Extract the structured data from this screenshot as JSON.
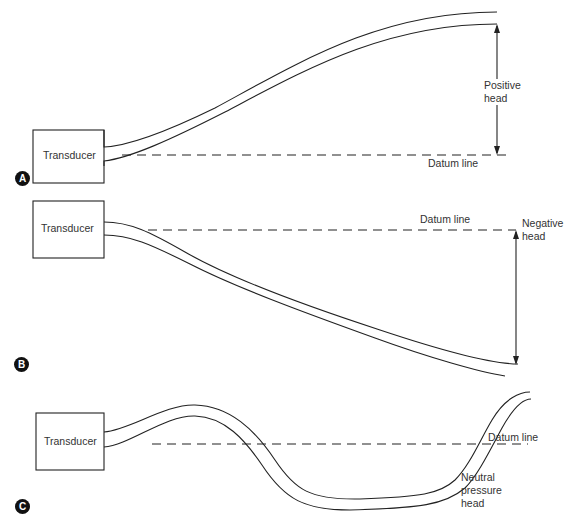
{
  "panels": [
    {
      "id": "A",
      "badge": "A",
      "transducer_label": "Transducer",
      "datum_label": "Datum line",
      "head_label_line1": "Positive",
      "head_label_line2": "head"
    },
    {
      "id": "B",
      "badge": "B",
      "transducer_label": "Transducer",
      "datum_label": "Datum line",
      "head_label_line1": "Negative",
      "head_label_line2": "head"
    },
    {
      "id": "C",
      "badge": "C",
      "transducer_label": "Transducer",
      "datum_label": "Datum line",
      "head_label_line1": "Neutral",
      "head_label_line2": "pressure",
      "head_label_line3": "head"
    }
  ],
  "colors": {
    "line": "#222222",
    "background": "#ffffff"
  }
}
